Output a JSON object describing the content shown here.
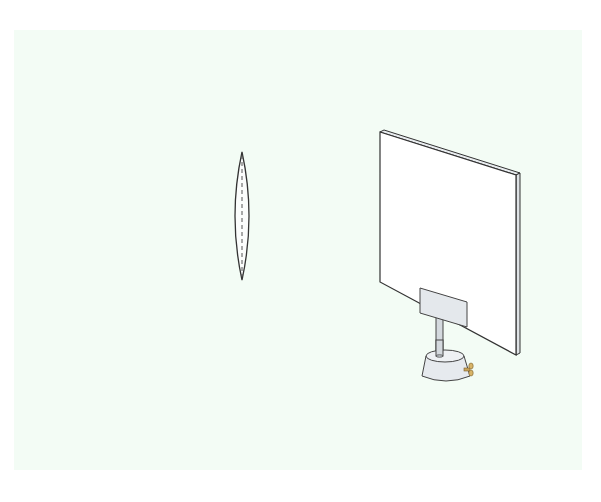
{
  "figure": {
    "background_color": "#f3fcf5",
    "objects": [
      {
        "name": "convex-lens",
        "label": ""
      },
      {
        "name": "light-screen",
        "label": ""
      },
      {
        "name": "screen-stand",
        "label": ""
      }
    ],
    "colors": {
      "outline": "#3a3a3a",
      "screen_face": "#ffffff",
      "bracket": "#e4e8ec",
      "post": "#d4d9de",
      "base": "#e6eaee",
      "knob": "#c9a45a"
    }
  }
}
